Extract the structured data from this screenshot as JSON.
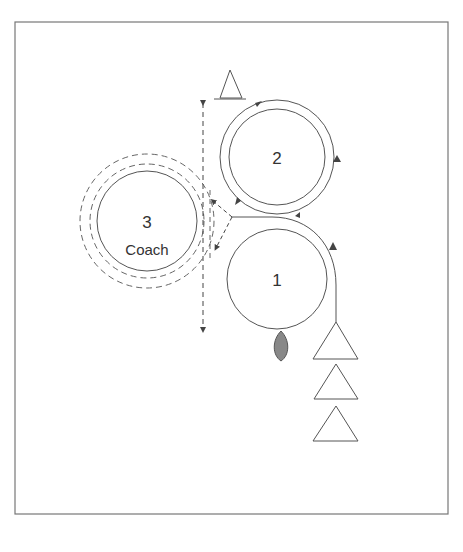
{
  "diagram": {
    "type": "coaching-drill",
    "stations": [
      {
        "id": "station-1",
        "number": "1",
        "label": ""
      },
      {
        "id": "station-2",
        "number": "2",
        "label": ""
      },
      {
        "id": "station-3",
        "number": "3",
        "label": "Coach"
      }
    ],
    "cones": {
      "queue_count": 3,
      "marker_count": 1
    },
    "ball": {
      "color": "#888888"
    },
    "colors": {
      "line": "#555555",
      "frame": "#777777",
      "text": "#333333"
    }
  }
}
